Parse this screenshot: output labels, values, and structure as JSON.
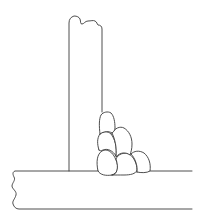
{
  "diagram": {
    "type": "multipass fillet weld on T-joint",
    "components": [
      {
        "id": "vertical-plate",
        "label": ""
      },
      {
        "id": "base-plate",
        "label": ""
      },
      {
        "id": "weld-beads",
        "count": 6
      }
    ],
    "colors": {
      "stroke": "#3a3a3a",
      "background": "#ffffff"
    }
  }
}
